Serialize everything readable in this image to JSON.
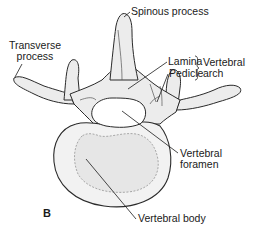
{
  "figure": {
    "panel_letter": "B",
    "labels": {
      "spinous_process": "Spinous process",
      "transverse_process_line1": "Transverse",
      "transverse_process_line2": "process",
      "lamina": "Lamina",
      "pedicle": "Pedicle",
      "vertebral_arch_line1": "Vertebral",
      "vertebral_arch_line2": "arch",
      "vertebral_foramen_line1": "Vertebral",
      "vertebral_foramen_line2": "foramen",
      "vertebral_body": "Vertebral body"
    },
    "colors": {
      "bone_fill": "#eeeeee",
      "outline": "#2a2a2a",
      "foramen_fill": "#ffffff",
      "text": "#1a1a1a"
    }
  }
}
